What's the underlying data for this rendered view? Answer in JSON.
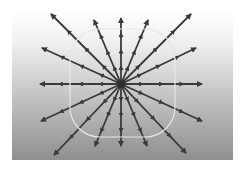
{
  "diagram": {
    "title": "",
    "background": {
      "x": 12,
      "y": 10,
      "width": 221,
      "height": 150,
      "gradient_top": "#ffffff",
      "gradient_bottom": "#8f8f8f"
    },
    "charge": {
      "name": "point-charge",
      "cx": 121,
      "cy": 84,
      "r": 4,
      "color": "#2e2e2e"
    },
    "field_line_color": "#3a3a3a",
    "surface": {
      "name": "gaussian-surface",
      "x": 70,
      "y": 29,
      "width": 105,
      "height": 108,
      "rx": 30,
      "color": "#e6e6e6"
    },
    "field_lines": [
      {
        "name": "field-line-n",
        "x2": 121,
        "y2": 18
      },
      {
        "name": "field-line-nne",
        "x2": 148,
        "y2": 20
      },
      {
        "name": "field-line-ne",
        "x2": 191,
        "y2": 14
      },
      {
        "name": "field-line-ene",
        "x2": 196,
        "y2": 48
      },
      {
        "name": "field-line-e",
        "x2": 202,
        "y2": 84
      },
      {
        "name": "field-line-ese",
        "x2": 202,
        "y2": 121
      },
      {
        "name": "field-line-se",
        "x2": 186,
        "y2": 153
      },
      {
        "name": "field-line-sse",
        "x2": 147,
        "y2": 146
      },
      {
        "name": "field-line-s",
        "x2": 121,
        "y2": 146
      },
      {
        "name": "field-line-ssw",
        "x2": 95,
        "y2": 146
      },
      {
        "name": "field-line-sw",
        "x2": 54,
        "y2": 155
      },
      {
        "name": "field-line-wsw",
        "x2": 41,
        "y2": 121
      },
      {
        "name": "field-line-w",
        "x2": 40,
        "y2": 84
      },
      {
        "name": "field-line-wnw",
        "x2": 42,
        "y2": 48
      },
      {
        "name": "field-line-nw",
        "x2": 51,
        "y2": 14
      },
      {
        "name": "field-line-nnw",
        "x2": 94,
        "y2": 20
      }
    ]
  }
}
